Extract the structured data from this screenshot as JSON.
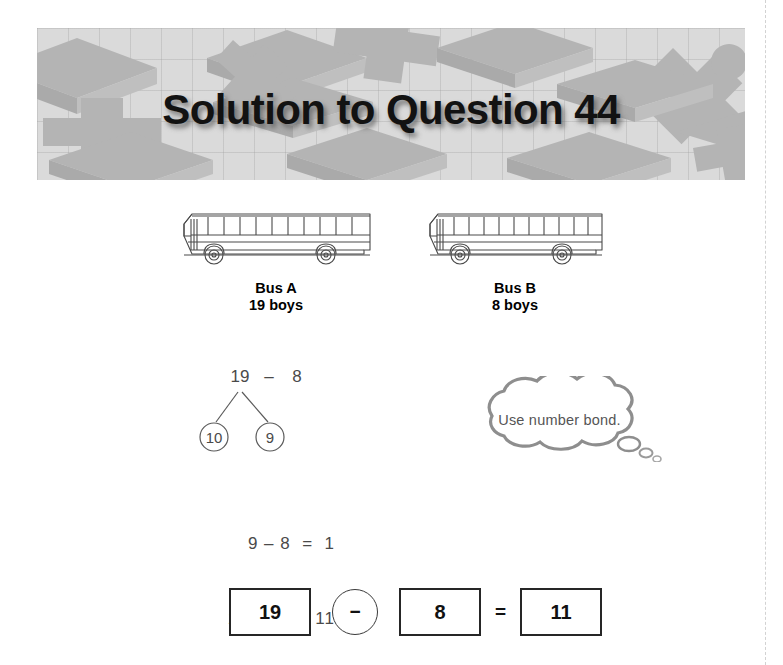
{
  "page": {
    "title": "Solution to Question 44"
  },
  "buses": [
    {
      "name": "Bus A",
      "count": "19 boys",
      "icon": "school-bus-icon"
    },
    {
      "name": "Bus B",
      "count": "8 boys",
      "icon": "school-bus-icon"
    }
  ],
  "number_bond": {
    "expression_left": "19",
    "expression_operator": "–",
    "expression_right": "8",
    "branch_left": "10",
    "branch_right": "9"
  },
  "hint": {
    "text": "Use number bond.",
    "icon": "thought-bubble-icon"
  },
  "working": {
    "line1": "9 – 8  =  1",
    "line2": "1 + 10  =  11"
  },
  "answer": {
    "operand_a": "19",
    "operator": "−",
    "operand_b": "8",
    "equals": "=",
    "result": "11"
  },
  "colors": {
    "banner_background": "#dadada",
    "banner_shape": "#b4b4b4",
    "title_text": "#121212",
    "hint_text": "#555555",
    "working_text": "#4a4a4a",
    "answer_border": "#262626"
  }
}
